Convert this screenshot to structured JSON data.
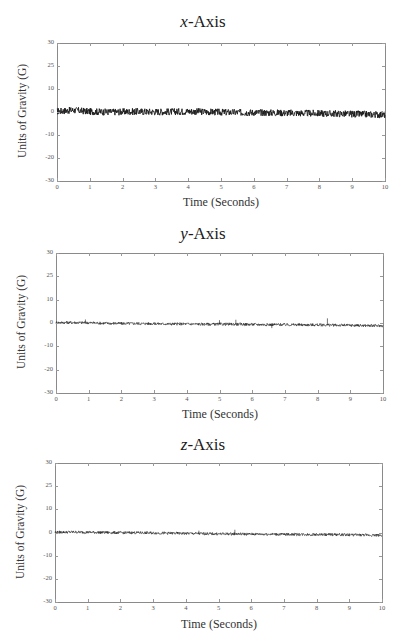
{
  "figure": {
    "panels": [
      {
        "title_var": "x",
        "title_rest": "-Axis"
      },
      {
        "title_var": "y",
        "title_rest": "-Axis"
      },
      {
        "title_var": "z",
        "title_rest": "-Axis"
      }
    ],
    "ylabel": "Units of Gravity (G)",
    "xlabel": "Time (Seconds)",
    "ytick_labels": [
      "30",
      "25",
      "10",
      "0",
      "-10",
      "-20",
      "-30"
    ],
    "xtick_labels": [
      "0",
      "1",
      "2",
      "3",
      "4",
      "5",
      "6",
      "7",
      "8",
      "9",
      "10"
    ],
    "trace_color": "#1a1a1a"
  },
  "chart_data": [
    {
      "type": "line",
      "title": "x-Axis",
      "xlabel": "Time (Seconds)",
      "ylabel": "Units of Gravity (G)",
      "xlim": [
        0,
        10
      ],
      "ylim": [
        -30,
        30
      ],
      "yticks": [
        "30",
        "25",
        "10",
        "0",
        "-10",
        "-20",
        "-30"
      ],
      "xticks": [
        0,
        1,
        2,
        3,
        4,
        5,
        6,
        7,
        8,
        9,
        10
      ],
      "grid": false,
      "legend": null,
      "series": [
        {
          "name": "x acceleration",
          "x": [
            0,
            0.5,
            1,
            1.5,
            2,
            2.5,
            3,
            3.5,
            4,
            4.5,
            5,
            5.5,
            6,
            6.5,
            7,
            7.5,
            8,
            8.5,
            9,
            9.5,
            10
          ],
          "values": [
            0.3,
            0.8,
            0.2,
            0.0,
            0.1,
            0.2,
            0.1,
            0.1,
            0.3,
            0.1,
            -0.1,
            -0.2,
            -0.2,
            -0.3,
            -0.4,
            -0.5,
            -0.6,
            -0.7,
            -0.9,
            -1.0,
            -1.2
          ],
          "noise_amplitude": 1.5
        }
      ]
    },
    {
      "type": "line",
      "title": "y-Axis",
      "xlabel": "Time (Seconds)",
      "ylabel": "Units of Gravity (G)",
      "xlim": [
        0,
        10
      ],
      "ylim": [
        -30,
        30
      ],
      "yticks": [
        "30",
        "25",
        "10",
        "0",
        "-10",
        "-20",
        "-30"
      ],
      "xticks": [
        0,
        1,
        2,
        3,
        4,
        5,
        6,
        7,
        8,
        9,
        10
      ],
      "grid": false,
      "legend": null,
      "series": [
        {
          "name": "y acceleration",
          "x": [
            0,
            0.5,
            1,
            1.5,
            2,
            2.5,
            3,
            3.5,
            4,
            4.5,
            5,
            5.5,
            6,
            6.5,
            7,
            7.5,
            8,
            8.5,
            9,
            9.5,
            10
          ],
          "values": [
            0.2,
            0.2,
            0.1,
            -0.1,
            -0.2,
            -0.2,
            -0.3,
            -0.4,
            -0.4,
            -0.5,
            -0.5,
            -0.5,
            -0.6,
            -0.7,
            -0.7,
            -0.8,
            -0.8,
            -0.9,
            -1.0,
            -1.1,
            -1.2
          ],
          "noise_amplitude": 0.6,
          "spikes": [
            {
              "x": 0.9,
              "y": 1.5
            },
            {
              "x": 5.0,
              "y": 1.2
            },
            {
              "x": 5.5,
              "y": 1.4
            },
            {
              "x": 6.6,
              "y": -2.2
            },
            {
              "x": 8.3,
              "y": 2.0
            }
          ]
        }
      ]
    },
    {
      "type": "line",
      "title": "z-Axis",
      "xlabel": "Time (Seconds)",
      "ylabel": "Units of Gravity (G)",
      "xlim": [
        0,
        10
      ],
      "ylim": [
        -30,
        30
      ],
      "yticks": [
        "30",
        "25",
        "10",
        "0",
        "-10",
        "-20",
        "-30"
      ],
      "xticks": [
        0,
        1,
        2,
        3,
        4,
        5,
        6,
        7,
        8,
        9,
        10
      ],
      "grid": false,
      "legend": null,
      "series": [
        {
          "name": "z acceleration",
          "x": [
            0,
            0.5,
            1,
            1.5,
            2,
            2.5,
            3,
            3.5,
            4,
            4.5,
            5,
            5.5,
            6,
            6.5,
            7,
            7.5,
            8,
            8.5,
            9,
            9.5,
            10
          ],
          "values": [
            0.1,
            0.2,
            0.1,
            0.0,
            -0.1,
            -0.1,
            -0.2,
            -0.3,
            -0.4,
            -0.5,
            -0.6,
            -0.6,
            -0.7,
            -0.7,
            -0.8,
            -0.8,
            -0.9,
            -0.9,
            -1.0,
            -1.1,
            -1.2
          ],
          "noise_amplitude": 0.6,
          "spikes": [
            {
              "x": 4.4,
              "y": 0.8
            },
            {
              "x": 5.5,
              "y": 1.2
            }
          ]
        }
      ]
    }
  ]
}
